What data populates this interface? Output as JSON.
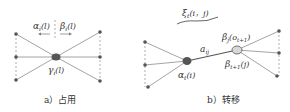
{
  "panel_a": {
    "caption": "a）占用",
    "alpha_label": "α",
    "alpha_sub": "i",
    "alpha_arg": "(l)",
    "beta_label": "β",
    "beta_sub": "i",
    "beta_arg": "(l)",
    "gamma_label": "γ",
    "gamma_sub": "i",
    "gamma_arg": "(l)"
  },
  "panel_b": {
    "caption": "b）转移",
    "xi_label": "ξ",
    "xi_sub": "t",
    "xi_arg": "(i，j)",
    "a_label": "a",
    "a_sub": "ij",
    "alpha_label": "α",
    "alpha_sub": "t",
    "alpha_arg": "(i)",
    "beta_top_label": "β",
    "beta_top_sub": "j",
    "beta_top_arg": "(o",
    "beta_top_arg_sub": "t+1",
    "beta_top_close": ")",
    "beta_bot_label": "β",
    "beta_bot_sub": "t+1",
    "beta_bot_arg": "(j)"
  },
  "colors": {
    "line": "#9a9a9a",
    "node_dark": "#555555",
    "node_light": "#d8d8d8",
    "text": "#333333"
  }
}
